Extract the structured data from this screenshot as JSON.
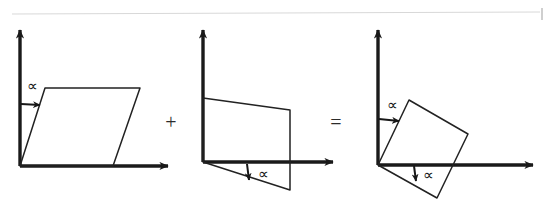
{
  "figure": {
    "background_color": "#ffffff",
    "ink_color": "#1a1a1a",
    "thin_ink_color": "#2e2e2e",
    "scan_edge_color": "#d8d8d8",
    "canvas": {
      "width": 553,
      "height": 207
    }
  },
  "operators": [
    {
      "name": "plus",
      "symbol": "+",
      "x": 171,
      "y": 124
    },
    {
      "name": "equals",
      "symbol": "=",
      "x": 336,
      "y": 124
    }
  ],
  "panels": [
    {
      "id": "panel-left",
      "name": "horizontal-shear-panel",
      "origin": {
        "x": 20,
        "y": 166
      },
      "axes": {
        "y_axis": {
          "x1": 20,
          "y1": 166,
          "x2": 20,
          "y2": 30
        },
        "x_axis": {
          "x1": 20,
          "y1": 166,
          "x2": 168,
          "y2": 166
        }
      },
      "shape": {
        "name": "sheared-parallelogram-horizontal",
        "points": "20,166 45,88 140,88 113,166",
        "vertices": [
          {
            "x": 20,
            "y": 166
          },
          {
            "x": 45,
            "y": 88
          },
          {
            "x": 140,
            "y": 88
          },
          {
            "x": 113,
            "y": 166
          }
        ]
      },
      "angle_label": {
        "text": "∝",
        "x": 32,
        "y": 88,
        "arrow": {
          "x1": 21,
          "y1": 104,
          "x2": 40,
          "y2": 105
        }
      }
    },
    {
      "id": "panel-middle",
      "name": "vertical-shear-panel",
      "origin": {
        "x": 203,
        "y": 162
      },
      "axes": {
        "y_axis": {
          "x1": 203,
          "y1": 162,
          "x2": 203,
          "y2": 30
        },
        "x_axis": {
          "x1": 203,
          "y1": 162,
          "x2": 333,
          "y2": 162
        }
      },
      "shape": {
        "name": "sheared-parallelogram-vertical",
        "points": "203,162 203,98 290,110 290,190 203,162",
        "vertices": [
          {
            "x": 203,
            "y": 98
          },
          {
            "x": 290,
            "y": 110
          },
          {
            "x": 290,
            "y": 190
          },
          {
            "x": 203,
            "y": 162
          }
        ]
      },
      "angle_label": {
        "text": "∝",
        "x": 263,
        "y": 176,
        "arrow": {
          "x1": 247,
          "y1": 164,
          "x2": 249,
          "y2": 180
        }
      }
    },
    {
      "id": "panel-right",
      "name": "rotated-square-panel",
      "origin": {
        "x": 378,
        "y": 165
      },
      "axes": {
        "y_axis": {
          "x1": 378,
          "y1": 165,
          "x2": 378,
          "y2": 30
        },
        "x_axis": {
          "x1": 378,
          "y1": 165,
          "x2": 533,
          "y2": 165
        }
      },
      "shape": {
        "name": "rotated-square",
        "points": "378,165 409,100 468,134 437,198",
        "vertices": [
          {
            "x": 378,
            "y": 165
          },
          {
            "x": 409,
            "y": 100
          },
          {
            "x": 468,
            "y": 134
          },
          {
            "x": 437,
            "y": 198
          }
        ]
      },
      "angle_labels": [
        {
          "name": "alpha-vertical",
          "text": "∝",
          "x": 392,
          "y": 107,
          "arrow": {
            "x1": 379,
            "y1": 119,
            "x2": 399,
            "y2": 121
          }
        },
        {
          "name": "alpha-horizontal",
          "text": "∝",
          "x": 428,
          "y": 177,
          "arrow": {
            "x1": 414,
            "y1": 166,
            "x2": 416,
            "y2": 181
          }
        }
      ]
    }
  ],
  "scan_artifacts": {
    "top_rule": {
      "x1": 12,
      "y1": 14,
      "x2": 540,
      "y2": 12
    },
    "corner_tick": {
      "x": 541,
      "y": 8,
      "width": 2,
      "height": 12
    }
  }
}
